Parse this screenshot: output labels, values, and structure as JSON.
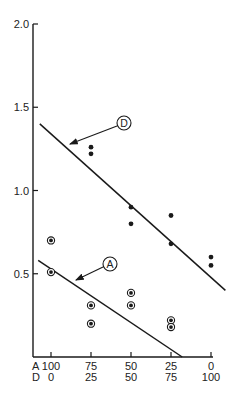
{
  "chart_data": {
    "type": "scatter",
    "title": "",
    "xlabel": "",
    "ylabel": "",
    "ylim": [
      0,
      2.0
    ],
    "yticks": [
      {
        "value": 0.5,
        "label": "0.5"
      },
      {
        "value": 1.0,
        "label": "1.0"
      },
      {
        "value": 1.5,
        "label": "1.5"
      },
      {
        "value": 2.0,
        "label": "2.0"
      }
    ],
    "x_axis": {
      "row_labels": [
        "A",
        "D"
      ],
      "ticks": [
        {
          "A": "100",
          "D": "0"
        },
        {
          "A": "75",
          "D": "25"
        },
        {
          "A": "50",
          "D": "50"
        },
        {
          "A": "25",
          "D": "75"
        },
        {
          "A": "0",
          "D": "100"
        }
      ],
      "x_values_A": [
        100,
        75,
        50,
        25,
        0
      ]
    },
    "grid": false,
    "series": [
      {
        "name": "D",
        "marker": "filled-dot",
        "points": [
          {
            "x": 75,
            "y": 1.26
          },
          {
            "x": 75,
            "y": 1.22
          },
          {
            "x": 50,
            "y": 0.9
          },
          {
            "x": 50,
            "y": 0.8
          },
          {
            "x": 25,
            "y": 0.85
          },
          {
            "x": 25,
            "y": 0.68
          },
          {
            "x": 0,
            "y": 0.6
          },
          {
            "x": 0,
            "y": 0.55
          }
        ],
        "fit_line": {
          "x1": 107,
          "y1": 1.4,
          "x2": -9,
          "y2": 0.4
        },
        "label": "D"
      },
      {
        "name": "A",
        "marker": "ringed-dot",
        "points": [
          {
            "x": 100,
            "y": 0.7
          },
          {
            "x": 100,
            "y": 0.51
          },
          {
            "x": 75,
            "y": 0.31
          },
          {
            "x": 75,
            "y": 0.2
          },
          {
            "x": 50,
            "y": 0.385
          },
          {
            "x": 50,
            "y": 0.31
          },
          {
            "x": 25,
            "y": 0.22
          },
          {
            "x": 25,
            "y": 0.18
          }
        ],
        "fit_line": {
          "x1": 108,
          "y1": 0.58,
          "x2": 18,
          "y2": 0.0
        },
        "label": "A"
      }
    ],
    "annotations": [
      {
        "text": "D",
        "style": "circled",
        "points_to": "D fit line"
      },
      {
        "text": "A",
        "style": "circled",
        "points_to": "A fit line"
      }
    ]
  },
  "colors": {
    "ink": "#1a1a1a",
    "background": "#ffffff"
  }
}
